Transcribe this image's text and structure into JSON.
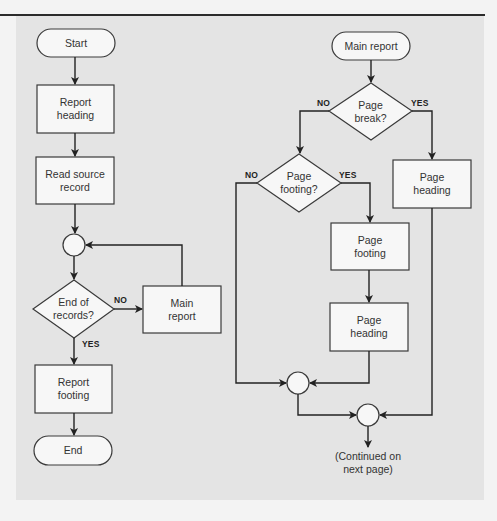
{
  "colors": {
    "background": "#f3f3f3",
    "panel": "#e4e4e4",
    "node_fill": "#f7f7f7",
    "stroke": "#3a3a3a"
  },
  "left_flow": {
    "start": "Start",
    "report_heading": "Report\nheading",
    "read_source_record": "Read source\nrecord",
    "end_of_records": "End of\nrecords?",
    "end_of_records_no": "NO",
    "end_of_records_yes": "YES",
    "main_report_process": "Main\nreport",
    "report_footing": "Report\nfooting",
    "end": "End"
  },
  "right_flow": {
    "main_report_start": "Main report",
    "page_break": "Page\nbreak?",
    "page_break_no": "NO",
    "page_break_yes": "YES",
    "page_footing_decision": "Page\nfooting?",
    "page_footing_no": "NO",
    "page_footing_yes": "YES",
    "page_footing_process": "Page\nfooting",
    "page_heading_middle": "Page\nheading",
    "page_heading_right": "Page\nheading",
    "continued": "(Continued on\nnext page)"
  }
}
